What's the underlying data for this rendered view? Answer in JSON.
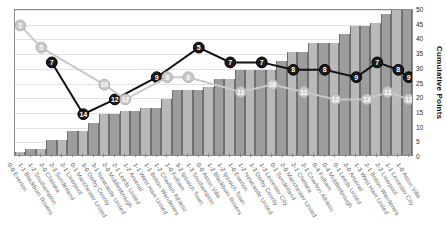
{
  "chart_data": {
    "type": "bar",
    "title": "",
    "xlabel": "",
    "ylabel": "Cumulative Points",
    "ylim": [
      0,
      50
    ],
    "yticks": [
      0,
      5,
      10,
      15,
      20,
      25,
      30,
      35,
      40,
      45,
      50
    ],
    "grid": true,
    "legend_position": "none",
    "categories": [
      "Everton",
      "Blackburn Rovers",
      "Southampton",
      "Chelsea",
      "Sunderland",
      "Liverpool",
      "Manchester United",
      "Derby County",
      "Newcastle United",
      "Middlesbrough",
      "Leeds United",
      "Arsenal",
      "West Ham United",
      "Bolton Wanderers",
      "Charlton Athletic",
      "Fulham",
      "Ipswich Town",
      "Southampton",
      "Aston Villa",
      "Blackburn Rovers",
      "Ipswich Town",
      "Everton",
      "Newcastle United",
      "Derby County",
      "Leicester City",
      "Sunderland",
      "Manchester United",
      "Chelsea",
      "Charlton Athletic",
      "Fulham",
      "Middlesbrough",
      "Leeds United",
      "Arsenal",
      "West Ham United",
      "Bolton Wanderers",
      "Liverpool",
      "Leicester City",
      "Aston Villa"
    ],
    "scores": [
      "0-0",
      "1-1",
      "1-2",
      "2-0",
      "2-3",
      "2-1",
      "0-1",
      "3-0",
      "3-1",
      "2-0",
      "2-1",
      "1-2",
      "1-1",
      "1-1",
      "1-2",
      "1-0",
      "3-2",
      "1-3",
      "0-0",
      "1-2",
      "1-2",
      "1-0",
      "1-2",
      "1-3",
      "1-3",
      "0-1",
      "2-0",
      "2-1",
      "2-1",
      "0-4",
      "0-4",
      "0-1",
      "2-0",
      "1-3",
      "2-1",
      "2-2",
      "1-1",
      "1-0"
    ],
    "series": [
      {
        "name": "Cumulative Points",
        "type": "bar",
        "values": [
          1,
          2,
          2,
          5,
          5,
          8,
          8,
          11,
          14,
          14,
          15,
          15,
          16,
          16,
          19,
          22,
          22,
          22,
          23,
          26,
          26,
          29,
          29,
          29,
          29,
          32,
          35,
          35,
          38,
          38,
          38,
          41,
          44,
          44,
          45,
          48,
          50,
          50
        ]
      },
      {
        "name": "League Position",
        "type": "line",
        "style": "dark",
        "labelled_points": [
          {
            "index": 3,
            "label": "7"
          },
          {
            "index": 6,
            "label": "14"
          },
          {
            "index": 9,
            "label": "12"
          },
          {
            "index": 13,
            "label": "9"
          },
          {
            "index": 17,
            "label": "5"
          },
          {
            "index": 20,
            "label": "7"
          },
          {
            "index": 23,
            "label": "7"
          },
          {
            "index": 26,
            "label": "8"
          },
          {
            "index": 29,
            "label": "8"
          },
          {
            "index": 32,
            "label": "9"
          },
          {
            "index": 34,
            "label": "7"
          },
          {
            "index": 36,
            "label": "8"
          },
          {
            "index": 37,
            "label": "9"
          }
        ]
      },
      {
        "name": "Opponent Position",
        "type": "line",
        "style": "light",
        "labelled_points": [
          {
            "index": 0,
            "label": "2"
          },
          {
            "index": 2,
            "label": "5"
          },
          {
            "index": 8,
            "label": "10"
          },
          {
            "index": 10,
            "label": "12"
          },
          {
            "index": 14,
            "label": "9"
          },
          {
            "index": 16,
            "label": "9"
          },
          {
            "index": 21,
            "label": "11"
          },
          {
            "index": 24,
            "label": "10"
          },
          {
            "index": 27,
            "label": "11"
          },
          {
            "index": 30,
            "label": "12"
          },
          {
            "index": 33,
            "label": "12"
          },
          {
            "index": 35,
            "label": "11"
          },
          {
            "index": 37,
            "label": "12"
          }
        ]
      }
    ]
  },
  "axis": {
    "y_title": "Cumulative Points"
  },
  "colors": {
    "bar_light": "#b9b9b9",
    "bar_dark": "#9d9d9d",
    "line_dark": "#111111",
    "line_light": "#c9c9c9",
    "grid": "#e2e2e2",
    "frame": "#8a8a8a"
  }
}
